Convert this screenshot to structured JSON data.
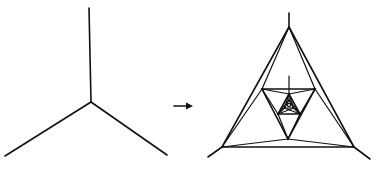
{
  "diagram": {
    "colors": {
      "stroke": "#111111",
      "background": "#ffffff"
    },
    "left_figure": {
      "name": "trivalent-vertex",
      "center": [
        91,
        102
      ],
      "arms": [
        [
          89,
          8
        ],
        [
          5,
          156
        ],
        [
          167,
          155
        ]
      ]
    },
    "arrow": {
      "from": [
        174,
        106
      ],
      "to": [
        193,
        106
      ],
      "label": ""
    },
    "right_figure": {
      "name": "nested-triangle-replacement",
      "outer_vertices": [
        [
          289,
          27
        ],
        [
          222,
          147
        ],
        [
          354,
          147
        ]
      ],
      "stubs": [
        [
          [
            289,
            27
          ],
          [
            289,
            13
          ]
        ],
        [
          [
            222,
            147
          ],
          [
            208,
            157
          ]
        ],
        [
          [
            354,
            147
          ],
          [
            370,
            159
          ]
        ]
      ],
      "middle_triangle": [
        [
          262,
          89
        ],
        [
          315,
          89
        ],
        [
          288,
          139
        ]
      ],
      "inner_triangle": [
        [
          289,
          94
        ],
        [
          278,
          114
        ],
        [
          300,
          114
        ]
      ],
      "center": [
        289,
        105
      ]
    }
  }
}
